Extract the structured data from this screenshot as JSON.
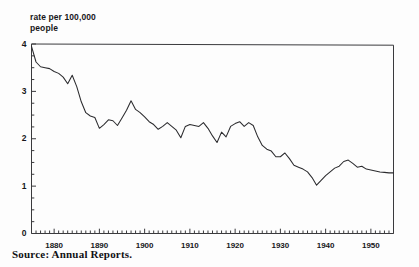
{
  "figure": {
    "axis_title": "rate per 100,000\npeople",
    "source_note": "Source: Annual Reports.",
    "line_color": "#2b2b2e",
    "frame_color": "#3a3a3d",
    "background": "#ffffff"
  },
  "axes": {
    "y_tick_labels": [
      "0",
      "1",
      "2",
      "3",
      "4"
    ],
    "x_tick_labels": [
      "1880",
      "1890",
      "1900",
      "1910",
      "1920",
      "1930",
      "1940",
      "1950"
    ]
  },
  "chart_data": {
    "type": "line",
    "title": "",
    "subtitle": "",
    "xlabel": "",
    "ylabel": "rate per 100,000 people",
    "xlim": [
      1875,
      1955
    ],
    "ylim": [
      0,
      4
    ],
    "grid": false,
    "legend": "none",
    "annotations": [
      "Source: Annual Reports."
    ],
    "x_major_ticks": [
      1880,
      1890,
      1900,
      1910,
      1920,
      1930,
      1940,
      1950
    ],
    "y_major_ticks": [
      0,
      1,
      2,
      3,
      4
    ],
    "y_minor_tick_step": 0.25,
    "x_minor_tick_step": 1,
    "series": [
      {
        "name": "rate per 100,000 people",
        "x": [
          1875,
          1876,
          1877,
          1878,
          1879,
          1880,
          1881,
          1882,
          1883,
          1884,
          1885,
          1886,
          1887,
          1888,
          1889,
          1890,
          1891,
          1892,
          1893,
          1894,
          1895,
          1896,
          1897,
          1898,
          1899,
          1900,
          1901,
          1902,
          1903,
          1904,
          1905,
          1906,
          1907,
          1908,
          1909,
          1910,
          1911,
          1912,
          1913,
          1914,
          1915,
          1916,
          1917,
          1918,
          1919,
          1920,
          1921,
          1922,
          1923,
          1924,
          1925,
          1926,
          1927,
          1928,
          1929,
          1930,
          1931,
          1932,
          1933,
          1934,
          1935,
          1936,
          1937,
          1938,
          1939,
          1940,
          1941,
          1942,
          1943,
          1944,
          1945,
          1946,
          1947,
          1948,
          1949,
          1950,
          1951,
          1952,
          1953,
          1954,
          1955
        ],
        "y": [
          3.95,
          3.62,
          3.52,
          3.5,
          3.48,
          3.42,
          3.38,
          3.3,
          3.16,
          3.34,
          3.1,
          2.78,
          2.55,
          2.48,
          2.45,
          2.22,
          2.3,
          2.4,
          2.38,
          2.28,
          2.44,
          2.6,
          2.8,
          2.62,
          2.55,
          2.46,
          2.36,
          2.3,
          2.2,
          2.26,
          2.34,
          2.26,
          2.18,
          2.02,
          2.26,
          2.3,
          2.28,
          2.26,
          2.34,
          2.22,
          2.06,
          1.92,
          2.14,
          2.04,
          2.26,
          2.32,
          2.36,
          2.26,
          2.34,
          2.28,
          2.04,
          1.86,
          1.78,
          1.74,
          1.62,
          1.62,
          1.7,
          1.58,
          1.44,
          1.4,
          1.36,
          1.3,
          1.18,
          1.02,
          1.12,
          1.22,
          1.3,
          1.38,
          1.42,
          1.52,
          1.55,
          1.48,
          1.4,
          1.42,
          1.36,
          1.34,
          1.32,
          1.3,
          1.29,
          1.28,
          1.28
        ]
      }
    ]
  }
}
